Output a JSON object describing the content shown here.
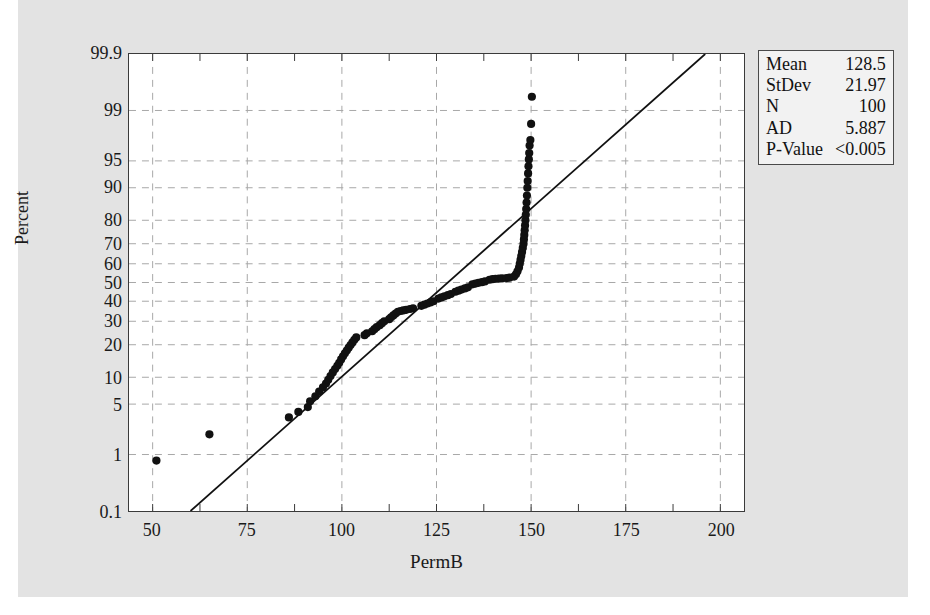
{
  "chart_data": {
    "type": "scatter",
    "title": "",
    "subtitle": "",
    "xlabel": "PermB",
    "ylabel": "Percent",
    "plot_kind": "normal-probability-plot",
    "xlim": [
      43.75,
      206.25
    ],
    "ylim_percent": [
      0.1,
      99.9
    ],
    "grid": true,
    "xticks": [
      50,
      75,
      100,
      125,
      150,
      175,
      200
    ],
    "xticklabels": [
      "50",
      "75",
      "100",
      "125",
      "150",
      "175",
      "200"
    ],
    "yticks": [
      0.1,
      1,
      5,
      10,
      20,
      30,
      40,
      50,
      60,
      70,
      80,
      90,
      95,
      99,
      99.9
    ],
    "yticklabels": [
      "0.1",
      "1",
      "5",
      "10",
      "20",
      "30",
      "40",
      "50",
      "60",
      "70",
      "80",
      "90",
      "95",
      "99",
      "99.9"
    ],
    "series": [
      {
        "name": "PermB percentiles",
        "marker": "filled-circle",
        "color": "#111111",
        "points": [
          [
            51.0,
            0.8
          ],
          [
            65.0,
            2.0
          ],
          [
            86.0,
            3.4
          ],
          [
            88.5,
            4.0
          ],
          [
            91.0,
            4.6
          ],
          [
            91.6,
            5.4
          ],
          [
            93.0,
            6.2
          ],
          [
            94.0,
            7.0
          ],
          [
            95.0,
            7.8
          ],
          [
            95.8,
            8.6
          ],
          [
            96.4,
            9.4
          ],
          [
            97.0,
            10.3
          ],
          [
            97.6,
            11.2
          ],
          [
            98.2,
            12.1
          ],
          [
            98.8,
            13.0
          ],
          [
            99.3,
            13.9
          ],
          [
            99.8,
            14.9
          ],
          [
            100.3,
            15.9
          ],
          [
            100.8,
            16.9
          ],
          [
            101.3,
            17.9
          ],
          [
            101.8,
            18.9
          ],
          [
            102.3,
            19.9
          ],
          [
            102.8,
            20.9
          ],
          [
            103.3,
            21.9
          ],
          [
            103.8,
            22.9
          ],
          [
            106.0,
            23.8
          ],
          [
            106.6,
            24.6
          ],
          [
            108.0,
            25.5
          ],
          [
            108.6,
            26.4
          ],
          [
            109.2,
            27.3
          ],
          [
            110.0,
            28.2
          ],
          [
            110.6,
            29.1
          ],
          [
            111.2,
            30.0
          ],
          [
            112.5,
            31.0
          ],
          [
            113.0,
            31.9
          ],
          [
            113.6,
            32.8
          ],
          [
            114.2,
            33.7
          ],
          [
            114.8,
            34.6
          ],
          [
            115.5,
            35.0
          ],
          [
            116.2,
            35.3
          ],
          [
            117.0,
            35.6
          ],
          [
            118.0,
            36.0
          ],
          [
            118.8,
            36.4
          ],
          [
            121.0,
            37.6
          ],
          [
            121.8,
            38.2
          ],
          [
            122.6,
            38.8
          ],
          [
            123.4,
            39.4
          ],
          [
            124.2,
            40.0
          ],
          [
            125.5,
            41.4
          ],
          [
            126.3,
            42.0
          ],
          [
            127.1,
            42.6
          ],
          [
            128.0,
            43.2
          ],
          [
            128.8,
            43.8
          ],
          [
            130.0,
            45.0
          ],
          [
            130.8,
            45.6
          ],
          [
            131.6,
            46.2
          ],
          [
            132.5,
            46.8
          ],
          [
            133.3,
            47.4
          ],
          [
            134.5,
            49.0
          ],
          [
            135.3,
            49.4
          ],
          [
            136.1,
            49.8
          ],
          [
            137.0,
            50.2
          ],
          [
            137.8,
            50.6
          ],
          [
            139.0,
            51.5
          ],
          [
            139.8,
            51.8
          ],
          [
            140.6,
            52.0
          ],
          [
            141.5,
            52.1
          ],
          [
            142.3,
            52.2
          ],
          [
            143.5,
            52.4
          ],
          [
            144.3,
            52.6
          ],
          [
            145.5,
            53.2
          ],
          [
            146.0,
            54.4
          ],
          [
            146.4,
            56.0
          ],
          [
            146.8,
            58.0
          ],
          [
            147.0,
            60.0
          ],
          [
            147.2,
            62.0
          ],
          [
            147.4,
            64.0
          ],
          [
            147.6,
            66.0
          ],
          [
            147.8,
            68.0
          ],
          [
            148.0,
            70.0
          ],
          [
            148.1,
            72.0
          ],
          [
            148.2,
            74.0
          ],
          [
            148.3,
            76.0
          ],
          [
            148.4,
            78.0
          ],
          [
            148.5,
            80.0
          ],
          [
            148.6,
            82.0
          ],
          [
            148.7,
            84.0
          ],
          [
            148.8,
            86.0
          ],
          [
            148.9,
            88.0
          ],
          [
            149.0,
            90.0
          ],
          [
            149.1,
            91.5
          ],
          [
            149.2,
            93.0
          ],
          [
            149.3,
            94.2
          ],
          [
            149.4,
            95.2
          ],
          [
            149.5,
            96.0
          ],
          [
            149.6,
            96.8
          ],
          [
            149.8,
            97.3
          ],
          [
            150.0,
            98.4
          ],
          [
            150.2,
            99.4
          ]
        ]
      }
    ],
    "fit_line": {
      "name": "normal distribution fit line",
      "color": "#111111",
      "mean": 128.5,
      "stdev": 21.97,
      "x_at_bottom_axis": 60.0,
      "x_at_top_axis": 196.0
    },
    "annotations": {
      "stats_rows": [
        {
          "key": "Mean",
          "value": "128.5"
        },
        {
          "key": "StDev",
          "value": "21.97"
        },
        {
          "key": "N",
          "value": "100"
        },
        {
          "key": "AD",
          "value": "5.887"
        },
        {
          "key": "P-Value",
          "value": "<0.005"
        }
      ]
    },
    "colors": {
      "page_background": "#ffffff",
      "figure_background": "#e3e3e3",
      "plot_background": "#ffffff",
      "frame": "#3a3a3a",
      "grid": "#a8a8a8",
      "marker": "#111111",
      "text": "#1a1a1a",
      "stats_box_bg": "#f2f2f2",
      "stats_box_border": "#4a4a4a"
    }
  }
}
